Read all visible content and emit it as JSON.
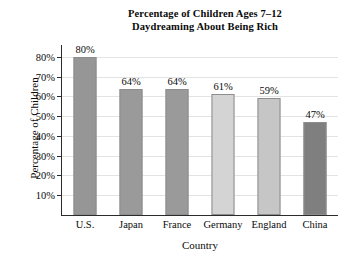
{
  "chart_data": {
    "type": "bar",
    "title": "Percentage of Children Ages 7–12 Daydreaming About Being Rich",
    "title_lines": [
      "Percentage of Children Ages 7–12",
      "Daydreaming About Being Rich"
    ],
    "xlabel": "Country",
    "ylabel": "Percentage of Children",
    "categories": [
      "U.S.",
      "Japan",
      "France",
      "Germany",
      "England",
      "China"
    ],
    "values": [
      80,
      64,
      64,
      61,
      59,
      47
    ],
    "value_labels": [
      "80%",
      "64%",
      "64%",
      "61%",
      "59%",
      "47%"
    ],
    "bar_colors": [
      "#969696",
      "#9a9a9a",
      "#9a9a9a",
      "#d4d4d4",
      "#c6c6c6",
      "#7f7f7f"
    ],
    "ylim": [
      0,
      85
    ],
    "y_ticks": [
      10,
      20,
      30,
      40,
      50,
      60,
      70,
      80
    ],
    "y_tick_labels": [
      "10%",
      "20%",
      "30%",
      "40%",
      "50%",
      "60%",
      "70%",
      "80%"
    ],
    "grid": true,
    "legend": false,
    "background_color": "#ffffff",
    "axis_color": "#2b2b2b",
    "gridline_color": "#e3e3e3"
  }
}
